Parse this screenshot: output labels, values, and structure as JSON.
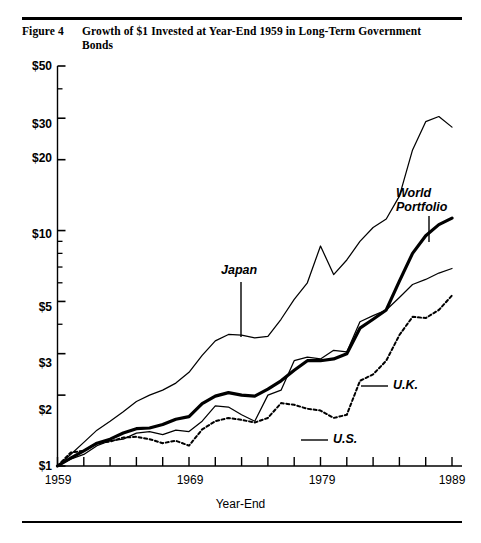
{
  "figure": {
    "number_label": "Figure 4",
    "title": "Growth of $1 Invested at Year-End 1959 in Long-Term Government Bonds"
  },
  "axis": {
    "xlabel": "Year-End",
    "x_tick_labels": [
      "1959",
      "1969",
      "1979",
      "1989"
    ],
    "y_tick_labels": [
      "$1",
      "$2",
      "$3",
      "$5",
      "$10",
      "$20",
      "$30",
      "$50"
    ]
  },
  "annotations": {
    "japan": "Japan",
    "world_portfolio_line1": "World",
    "world_portfolio_line2": "Portfolio",
    "uk": "U.K.",
    "us": "U.S."
  },
  "chart_data": {
    "type": "line",
    "title": "Growth of $1 Invested at Year-End 1959 in Long-Term Government Bonds",
    "xlabel": "Year-End",
    "ylabel": "",
    "yscale": "log",
    "ylim": [
      1,
      50
    ],
    "xlim": [
      1959,
      1989
    ],
    "grid": false,
    "legend": "inline-annotations",
    "y_ticks": [
      1,
      2,
      3,
      5,
      10,
      20,
      30,
      50
    ],
    "y_tick_labels": [
      "$1",
      "$2",
      "$3",
      "$5",
      "$10",
      "$20",
      "$30",
      "$50"
    ],
    "x_ticks": [
      1959,
      1961,
      1963,
      1965,
      1967,
      1969,
      1971,
      1973,
      1975,
      1977,
      1979,
      1981,
      1983,
      1985,
      1987,
      1989
    ],
    "x_tick_labels_shown": [
      1959,
      1969,
      1979,
      1989
    ],
    "x": [
      1959,
      1960,
      1961,
      1962,
      1963,
      1964,
      1965,
      1966,
      1967,
      1968,
      1969,
      1970,
      1971,
      1972,
      1973,
      1974,
      1975,
      1976,
      1977,
      1978,
      1979,
      1980,
      1981,
      1982,
      1983,
      1984,
      1985,
      1986,
      1987,
      1988,
      1989
    ],
    "series": [
      {
        "name": "Japan",
        "style": "thin-solid",
        "color": "#000000",
        "values": [
          1.0,
          1.12,
          1.26,
          1.42,
          1.55,
          1.7,
          1.88,
          2.0,
          2.1,
          2.25,
          2.5,
          2.95,
          3.4,
          3.62,
          3.6,
          3.5,
          3.55,
          4.2,
          5.1,
          6.0,
          8.6,
          6.5,
          7.5,
          9.0,
          10.3,
          11.2,
          14.0,
          22.0,
          29.0,
          30.5,
          27.5
        ]
      },
      {
        "name": "World Portfolio",
        "style": "thick-solid",
        "color": "#000000",
        "values": [
          1.0,
          1.08,
          1.16,
          1.25,
          1.3,
          1.38,
          1.44,
          1.45,
          1.5,
          1.58,
          1.62,
          1.84,
          1.98,
          2.05,
          2.0,
          1.98,
          2.12,
          2.3,
          2.55,
          2.8,
          2.8,
          2.85,
          3.0,
          3.85,
          4.2,
          4.6,
          6.1,
          8.0,
          9.5,
          10.6,
          11.3
        ]
      },
      {
        "name": "U.K.",
        "style": "thin-solid",
        "color": "#000000",
        "values": [
          1.0,
          1.07,
          1.12,
          1.22,
          1.28,
          1.3,
          1.38,
          1.4,
          1.36,
          1.42,
          1.4,
          1.55,
          1.8,
          1.78,
          1.65,
          1.55,
          2.0,
          2.1,
          2.8,
          2.9,
          2.85,
          3.1,
          3.05,
          4.1,
          4.35,
          4.6,
          5.2,
          5.9,
          6.2,
          6.6,
          6.9
        ]
      },
      {
        "name": "U.S.",
        "style": "dotted",
        "color": "#000000",
        "values": [
          1.0,
          1.14,
          1.16,
          1.25,
          1.27,
          1.32,
          1.33,
          1.3,
          1.25,
          1.28,
          1.22,
          1.43,
          1.55,
          1.6,
          1.57,
          1.53,
          1.6,
          1.85,
          1.82,
          1.75,
          1.72,
          1.6,
          1.65,
          2.3,
          2.45,
          2.8,
          3.6,
          4.3,
          4.25,
          4.6,
          5.3
        ]
      }
    ],
    "annotations": [
      {
        "text": "Japan",
        "x": 1972,
        "y": 5.0
      },
      {
        "text": "World Portfolio",
        "x": 1985,
        "y": 16.0
      },
      {
        "text": "U.K.",
        "x": 1985,
        "y": 2.6
      },
      {
        "text": "U.S.",
        "x": 1979,
        "y": 1.55
      }
    ]
  }
}
